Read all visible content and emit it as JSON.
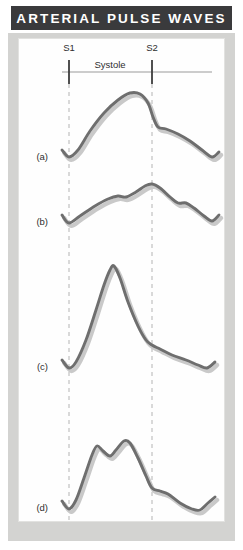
{
  "header": {
    "title": "ARTERIAL PULSE WAVES",
    "background_color": "#3a3a3c",
    "text_color": "#ffffff"
  },
  "panel": {
    "background_color": "#fefefe",
    "frame_color": "#d3d3d1"
  },
  "annotations": {
    "s1_label": "S1",
    "s2_label": "S2",
    "systole_label": "Systole"
  },
  "traces": {
    "a": {
      "label": "(a)"
    },
    "b": {
      "label": "(b)"
    },
    "c": {
      "label": "(c)"
    },
    "d": {
      "label": "(d)"
    }
  },
  "chart_data": {
    "type": "line",
    "title": "ARTERIAL PULSE WAVES",
    "xlabel": "",
    "ylabel": "",
    "grid": false,
    "legend_position": "none",
    "line_color": "#6e6e6e",
    "shadow_color": "#c9c9c9",
    "annotation_marks": [
      {
        "name": "S1",
        "x": 69,
        "label": "S1"
      },
      {
        "name": "S2",
        "x": 152,
        "label": "S2"
      }
    ],
    "interval_bars": [
      {
        "label": "Systole",
        "from_x": 69,
        "to_x": 152
      }
    ],
    "series": [
      {
        "name": "(a)",
        "baseline_y": 157,
        "description": "normal arterial pulse with dicrotic notch",
        "points": [
          [
            62,
            150
          ],
          [
            69,
            157
          ],
          [
            78,
            150
          ],
          [
            90,
            131
          ],
          [
            104,
            113
          ],
          [
            118,
            100
          ],
          [
            130,
            93
          ],
          [
            140,
            94
          ],
          [
            148,
            103
          ],
          [
            153,
            117
          ],
          [
            158,
            127
          ],
          [
            166,
            129
          ],
          [
            178,
            134
          ],
          [
            190,
            141
          ],
          [
            202,
            150
          ],
          [
            212,
            157
          ],
          [
            219,
            152
          ]
        ]
      },
      {
        "name": "(b)",
        "baseline_y": 222,
        "description": "pulsus tardus et parvus, slow rising with anacrotic shoulder",
        "points": [
          [
            62,
            215
          ],
          [
            69,
            223
          ],
          [
            80,
            216
          ],
          [
            95,
            206
          ],
          [
            108,
            199
          ],
          [
            118,
            196
          ],
          [
            126,
            197
          ],
          [
            136,
            192
          ],
          [
            145,
            186
          ],
          [
            152,
            184
          ],
          [
            160,
            188
          ],
          [
            170,
            197
          ],
          [
            178,
            203
          ],
          [
            186,
            203
          ],
          [
            194,
            208
          ],
          [
            204,
            216
          ],
          [
            212,
            221
          ],
          [
            219,
            215
          ]
        ]
      },
      {
        "name": "(c)",
        "baseline_y": 367,
        "description": "water-hammer / collapsing pulse, tall narrow spike",
        "points": [
          [
            62,
            360
          ],
          [
            69,
            368
          ],
          [
            76,
            362
          ],
          [
            86,
            340
          ],
          [
            96,
            310
          ],
          [
            104,
            285
          ],
          [
            110,
            270
          ],
          [
            114,
            266
          ],
          [
            120,
            278
          ],
          [
            128,
            302
          ],
          [
            138,
            326
          ],
          [
            146,
            340
          ],
          [
            152,
            345
          ],
          [
            160,
            349
          ],
          [
            172,
            355
          ],
          [
            186,
            360
          ],
          [
            198,
            365
          ],
          [
            207,
            368
          ],
          [
            215,
            362
          ]
        ]
      },
      {
        "name": "(d)",
        "baseline_y": 508,
        "description": "pulsus bisferiens, two systolic peaks",
        "points": [
          [
            62,
            501
          ],
          [
            69,
            509
          ],
          [
            76,
            500
          ],
          [
            84,
            478
          ],
          [
            92,
            455
          ],
          [
            97,
            446
          ],
          [
            103,
            451
          ],
          [
            110,
            456
          ],
          [
            116,
            450
          ],
          [
            124,
            441
          ],
          [
            130,
            443
          ],
          [
            138,
            458
          ],
          [
            146,
            476
          ],
          [
            152,
            488
          ],
          [
            160,
            491
          ],
          [
            168,
            494
          ],
          [
            180,
            503
          ],
          [
            192,
            509
          ],
          [
            200,
            510
          ],
          [
            208,
            503
          ],
          [
            215,
            497
          ]
        ]
      }
    ]
  }
}
